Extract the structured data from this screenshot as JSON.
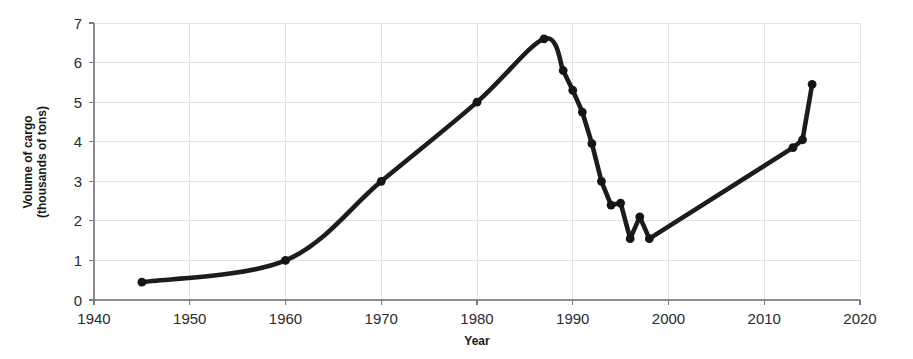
{
  "chart_data": {
    "type": "line",
    "title": "",
    "xlabel": "Year",
    "ylabel": "Volume of cargo (thousands of tons)",
    "ylabel_line1": "Volume of cargo",
    "ylabel_line2": "(thousands of tons)",
    "xlim": [
      1940,
      2020
    ],
    "ylim": [
      0,
      7
    ],
    "xticks": [
      1940,
      1950,
      1960,
      1970,
      1980,
      1990,
      2000,
      2010,
      2020
    ],
    "yticks": [
      0,
      1,
      2,
      3,
      4,
      5,
      6,
      7
    ],
    "xtick_labels": [
      "1940",
      "1950",
      "1960",
      "1970",
      "1980",
      "1990",
      "2000",
      "2010",
      "2020"
    ],
    "ytick_labels": [
      "0",
      "1",
      "2",
      "3",
      "4",
      "5",
      "6",
      "7"
    ],
    "grid": true,
    "legend": false,
    "marker": "filled-circle",
    "line_color": "#1c1c1c",
    "grid_color": "#e2e2e6",
    "x": [
      1945,
      1960,
      1970,
      1980,
      1987,
      1989,
      1990,
      1991,
      1992,
      1993,
      1994,
      1995,
      1996,
      1997,
      1998,
      2013,
      2014,
      2015
    ],
    "y": [
      0.45,
      1.0,
      3.0,
      5.0,
      6.6,
      5.8,
      5.3,
      4.75,
      3.95,
      3.0,
      2.4,
      2.45,
      1.55,
      2.1,
      1.55,
      3.85,
      4.05,
      5.45
    ],
    "points": [
      {
        "x": 1945,
        "y": 0.45
      },
      {
        "x": 1960,
        "y": 1.0
      },
      {
        "x": 1970,
        "y": 3.0
      },
      {
        "x": 1980,
        "y": 5.0
      },
      {
        "x": 1987,
        "y": 6.6
      },
      {
        "x": 1989,
        "y": 5.8
      },
      {
        "x": 1990,
        "y": 5.3
      },
      {
        "x": 1991,
        "y": 4.75
      },
      {
        "x": 1992,
        "y": 3.95
      },
      {
        "x": 1993,
        "y": 3.0
      },
      {
        "x": 1994,
        "y": 2.4
      },
      {
        "x": 1995,
        "y": 2.45
      },
      {
        "x": 1996,
        "y": 1.55
      },
      {
        "x": 1997,
        "y": 2.1
      },
      {
        "x": 1998,
        "y": 1.55
      },
      {
        "x": 2013,
        "y": 3.85
      },
      {
        "x": 2014,
        "y": 4.05
      },
      {
        "x": 2015,
        "y": 5.45
      }
    ],
    "smooth_through": 1987,
    "series_name": "Volume of cargo"
  }
}
